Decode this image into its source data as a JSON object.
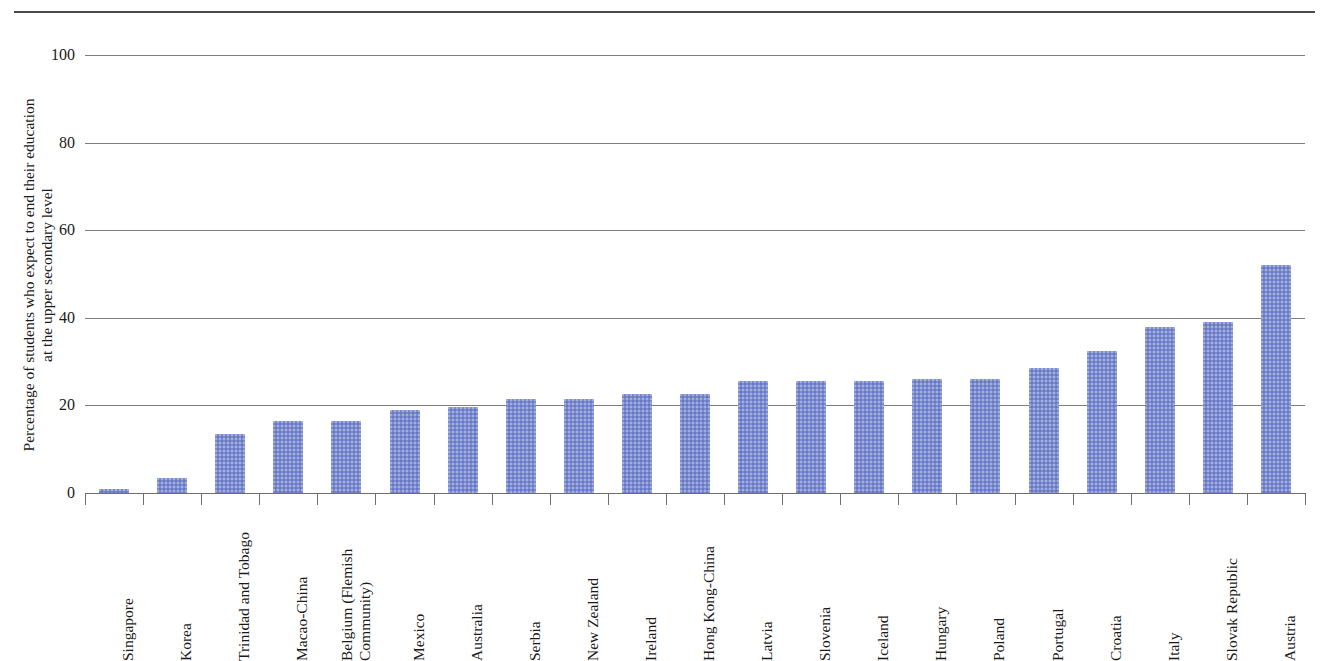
{
  "chart_data": {
    "type": "bar",
    "title": "",
    "subtitle": "",
    "xlabel": "",
    "ylabel_lines": [
      "Percentage of students who expect to end their education",
      "at the upper secondary level"
    ],
    "ylabel": "Percentage of students who expect to end their education at the upper secondary level",
    "ylim": [
      0,
      100
    ],
    "yticks": [
      0,
      20,
      40,
      60,
      80,
      100
    ],
    "ytick_labels": [
      "0",
      "20",
      "40",
      "60",
      "80",
      "100"
    ],
    "grid": true,
    "legend": "none",
    "bar_color": "#7b8bd0",
    "gridline_color": "#7d7d7d",
    "categories": [
      "Singapore",
      "Korea",
      "Trinidad and Tobago",
      "Macao-China",
      "Belgium (Flemish Community)",
      "Mexico",
      "Australia",
      "Serbia",
      "New Zealand",
      "Ireland",
      "Hong Kong-China",
      "Latvia",
      "Slovenia",
      "Iceland",
      "Hungary",
      "Poland",
      "Portugal",
      "Croatia",
      "Italy",
      "Slovak Republic",
      "Austria"
    ],
    "category_label_lines": [
      [
        "Singapore"
      ],
      [
        "Korea"
      ],
      [
        "Trinidad and Tobago"
      ],
      [
        "Macao-China"
      ],
      [
        "Belgium (Flemish",
        "Community)"
      ],
      [
        "Mexico"
      ],
      [
        "Australia"
      ],
      [
        "Serbia"
      ],
      [
        "New Zealand"
      ],
      [
        "Ireland"
      ],
      [
        "Hong Kong-China"
      ],
      [
        "Latvia"
      ],
      [
        "Slovenia"
      ],
      [
        "Iceland"
      ],
      [
        "Hungary"
      ],
      [
        "Poland"
      ],
      [
        "Portugal"
      ],
      [
        "Croatia"
      ],
      [
        "Italy"
      ],
      [
        "Slovak Republic"
      ],
      [
        "Austria"
      ]
    ],
    "values": [
      1.0,
      3.5,
      13.5,
      16.5,
      16.5,
      19.0,
      19.7,
      21.5,
      21.5,
      22.5,
      22.5,
      25.5,
      25.5,
      25.5,
      26.0,
      26.0,
      28.5,
      32.5,
      37.8,
      39.0,
      52.0
    ]
  }
}
